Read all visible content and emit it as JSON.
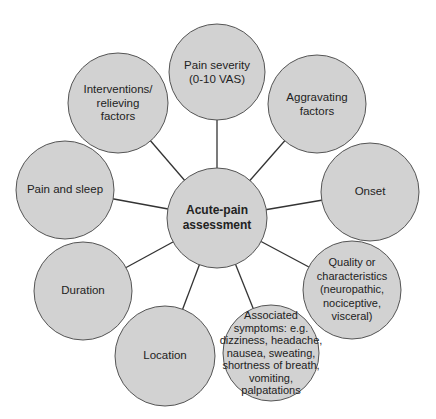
{
  "diagram": {
    "type": "hub-and-spoke",
    "colors": {
      "node_fill": "#d2d2d2",
      "node_stroke": "#555555",
      "connector": "#333333",
      "text": "#222222"
    },
    "center": {
      "label": "Acute-pain\nassessment",
      "cx": 217,
      "cy": 218,
      "r": 50
    },
    "nodes": [
      {
        "id": "pain-severity",
        "label": "Pain severity\n(0-10 VAS)",
        "cx": 217,
        "cy": 72,
        "r": 48
      },
      {
        "id": "aggravating-factors",
        "label": "Aggravating\nfactors",
        "cx": 317,
        "cy": 104,
        "r": 49
      },
      {
        "id": "onset",
        "label": "Onset",
        "cx": 370,
        "cy": 192,
        "r": 49
      },
      {
        "id": "quality",
        "label": "Quality or\ncharacteristics\n(neuropathic,\nnociceptive,\nvisceral)",
        "cx": 352,
        "cy": 290,
        "r": 49
      },
      {
        "id": "associated-symptoms",
        "label": "Associated\nsymptoms: e.g.\ndizziness, headache,\nnausea, sweating,\nshortness of breath,\nvomiting,\npalpatations",
        "cx": 271,
        "cy": 353,
        "r": 48
      },
      {
        "id": "location",
        "label": "Location",
        "cx": 165,
        "cy": 356,
        "r": 50
      },
      {
        "id": "duration",
        "label": "Duration",
        "cx": 83,
        "cy": 291,
        "r": 49
      },
      {
        "id": "pain-and-sleep",
        "label": "Pain and sleep",
        "cx": 65,
        "cy": 190,
        "r": 49
      },
      {
        "id": "interventions",
        "label": "Interventions/\nrelieving\nfactors",
        "cx": 118,
        "cy": 103,
        "r": 50
      }
    ]
  }
}
